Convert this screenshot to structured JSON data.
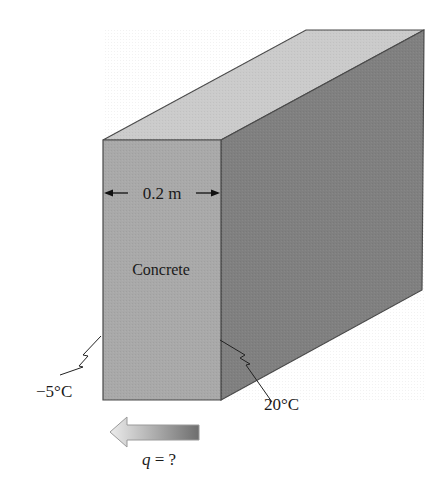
{
  "figure": {
    "material_label": "Concrete",
    "thickness_label": "0.2 m",
    "left_temperature": "−5°C",
    "right_temperature": "20°C",
    "heat_flow_label_var": "q",
    "heat_flow_label_rest": " = ?",
    "heat_flow_direction": "left"
  },
  "colors": {
    "front_face": "#a9a9a9",
    "top_face": "#c9c9c9",
    "side_face": "#7f7f7f",
    "edge": "#4a4a4a",
    "arrow_light": "#e6e6e6",
    "arrow_dark": "#707070"
  }
}
